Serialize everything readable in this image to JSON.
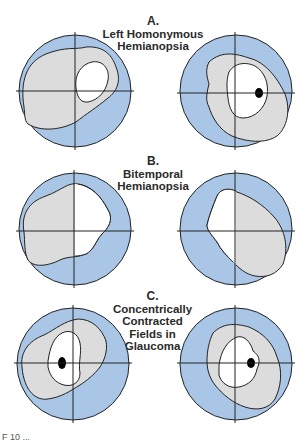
{
  "figure": {
    "panels": [
      {
        "id": "A",
        "letter": "A.",
        "title_lines": [
          "Left Homonymous",
          "Hemianopsia"
        ],
        "left_eye": "Left visual field: shaded region limited to left/central field with small white central area",
        "right_eye": "Right visual field: shaded region with white central area and black blind spot on right"
      },
      {
        "id": "B",
        "letter": "B.",
        "title_lines": [
          "Bitemporal",
          "Hemianopsia"
        ],
        "left_eye": "Temporal (left) half shaded, nasal half white",
        "right_eye": "Temporal (right) half shaded, nasal half white"
      },
      {
        "id": "C",
        "letter": "C.",
        "title_lines": [
          "Concentrically",
          "Contracted",
          "Fields in",
          "Glaucoma"
        ],
        "left_eye": "Contracted shaded ring with small white center and black blind spot",
        "right_eye": "Contracted shaded ring with small white center and black blind spot"
      }
    ],
    "caption": "F 10 ..."
  },
  "colors": {
    "outer_field": "#a9c6e6",
    "shaded_field": "#dcdcdc",
    "central_field": "#ffffff",
    "outline": "#222222",
    "blind_spot": "#000000"
  }
}
